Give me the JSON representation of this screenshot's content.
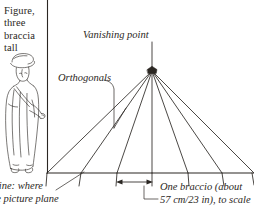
{
  "figure": {
    "background_color": "#ffffff",
    "ink_color": "#2b2723",
    "width": 254,
    "height": 208
  },
  "labels": {
    "figure_height": "Figure,\nthree\nbraccia\ntall",
    "vanishing_point": "Vanishing point",
    "orthogonals": "Orthogonals",
    "ground_line": "d line: where\nthe picture plane",
    "braccio_scale": "One braccio (about\n57 cm/23 in), to scale"
  },
  "diagram": {
    "vanishing_point": {
      "x": 152,
      "y": 71
    },
    "picture_plane_line": {
      "x": 47,
      "y_top": 0,
      "y_bottom": 173
    },
    "ground_line": {
      "y": 173,
      "x_start": 47,
      "x_end": 254
    },
    "ground_line_ticks": [
      47,
      81,
      117,
      152,
      188,
      222,
      253
    ],
    "orthogonal_endpoints_x": [
      47,
      81,
      117,
      152,
      188,
      222,
      253
    ],
    "orthogonal_count": 7,
    "scale_arrow": {
      "x_start": 117,
      "x_end": 152,
      "y": 182
    },
    "standing_figure": {
      "description": "robed man wearing a cap, standing, arm extended",
      "ground_y": 172,
      "head_y": 56
    }
  }
}
